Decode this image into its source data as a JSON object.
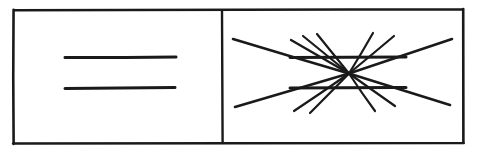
{
  "figure": {
    "medium": "black ink line drawing on white paper",
    "background_color": "#ffffff",
    "ink_color": "#1a1a1a",
    "width": 478,
    "height": 153
  },
  "frame": {
    "name": "outer-rectangle",
    "x": 14,
    "y": 10,
    "width": 449,
    "height": 133,
    "stroke_width": 2.6
  },
  "divider": {
    "name": "vertical-divider",
    "x": 222,
    "y1": 11,
    "y2": 142,
    "stroke_width": 2.4
  },
  "left_panel": {
    "name": "plain-parallel-lines-panel",
    "label": "Control: two plain parallel horizontal lines",
    "lines": [
      {
        "name": "upper-parallel-line",
        "x1": 65,
        "y1": 57.5,
        "x2": 176,
        "y2": 57.0,
        "stroke_width": 3.0
      },
      {
        "name": "lower-parallel-line",
        "x1": 65,
        "y1": 88.5,
        "x2": 175,
        "y2": 87.5,
        "stroke_width": 3.0
      }
    ]
  },
  "right_panel": {
    "name": "illusion-panel",
    "label": "Illusion: same two parallel lines over a radiating fan",
    "convergence_point": {
      "x": 349,
      "y": 73.5
    },
    "horizontal_lines": [
      {
        "name": "upper-test-line",
        "x1": 290,
        "y1": 57.5,
        "x2": 406,
        "y2": 57.0,
        "stroke_width": 3.0
      },
      {
        "name": "lower-test-line",
        "x1": 290,
        "y1": 88.0,
        "x2": 406,
        "y2": 87.5,
        "stroke_width": 3.0
      }
    ],
    "radiating_lines": [
      {
        "name": "ray-upper-left-long",
        "x1": 349,
        "y1": 73.5,
        "x2": 233,
        "y2": 39.0,
        "stroke_width": 2.6
      },
      {
        "name": "ray-upper-left-mid",
        "x1": 349,
        "y1": 73.5,
        "x2": 291,
        "y2": 40.0,
        "stroke_width": 2.4
      },
      {
        "name": "ray-upper-left-steep-a",
        "x1": 349,
        "y1": 73.5,
        "x2": 303,
        "y2": 36.0,
        "stroke_width": 2.2
      },
      {
        "name": "ray-upper-left-steep-b",
        "x1": 349,
        "y1": 73.5,
        "x2": 317,
        "y2": 34.0,
        "stroke_width": 2.2
      },
      {
        "name": "ray-upper-right-steep-a",
        "x1": 349,
        "y1": 73.5,
        "x2": 373,
        "y2": 33.0,
        "stroke_width": 2.2
      },
      {
        "name": "ray-upper-right-steep-b",
        "x1": 349,
        "y1": 73.5,
        "x2": 394,
        "y2": 36.0,
        "stroke_width": 2.2
      },
      {
        "name": "ray-upper-right-long",
        "x1": 349,
        "y1": 73.5,
        "x2": 452,
        "y2": 39.0,
        "stroke_width": 2.6
      },
      {
        "name": "ray-lower-left-long",
        "x1": 349,
        "y1": 73.5,
        "x2": 235,
        "y2": 107.0,
        "stroke_width": 2.6
      },
      {
        "name": "ray-lower-left-mid",
        "x1": 349,
        "y1": 73.5,
        "x2": 294,
        "y2": 111.0,
        "stroke_width": 2.2
      },
      {
        "name": "ray-lower-left-steep",
        "x1": 349,
        "y1": 73.5,
        "x2": 310,
        "y2": 113.0,
        "stroke_width": 2.2
      },
      {
        "name": "ray-lower-right-steep-a",
        "x1": 349,
        "y1": 73.5,
        "x2": 375,
        "y2": 111.0,
        "stroke_width": 2.2
      },
      {
        "name": "ray-lower-right-steep-b",
        "x1": 349,
        "y1": 73.5,
        "x2": 395,
        "y2": 106.0,
        "stroke_width": 2.2
      },
      {
        "name": "ray-lower-right-long",
        "x1": 349,
        "y1": 73.5,
        "x2": 450,
        "y2": 105.0,
        "stroke_width": 2.6
      }
    ]
  }
}
